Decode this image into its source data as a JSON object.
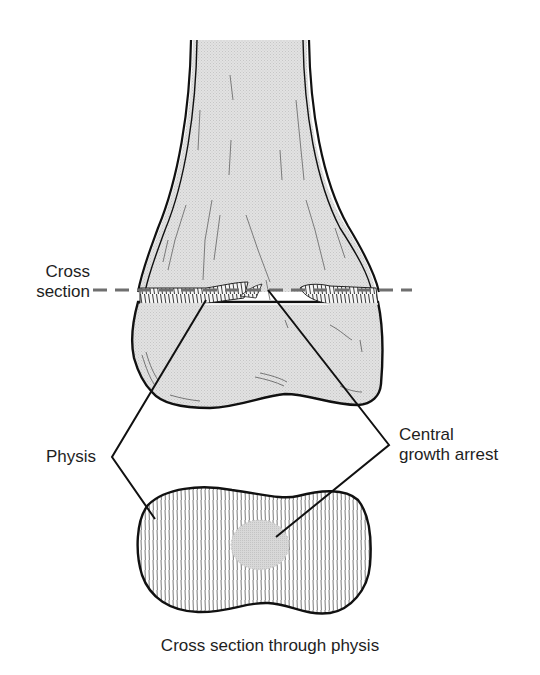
{
  "figure": {
    "colors": {
      "bone_fill": "#dcdcdc",
      "outline": "#111111",
      "dashed_line": "#6f6f6f",
      "arrest_fill": "#d4d4d4",
      "background": "#ffffff"
    }
  },
  "labels": {
    "cross_section": [
      "Cross",
      "section"
    ],
    "physis": "Physis",
    "central_growth_arrest": [
      "Central",
      "growth arrest"
    ],
    "caption": "Cross section through physis"
  },
  "diagram": {
    "elements": [
      {
        "id": "femur-diaphysis",
        "description": "Distal femur shaft flaring into metaphysis"
      },
      {
        "id": "physis-band",
        "description": "Growth plate band with gap at center (bony bar)"
      },
      {
        "id": "epiphysis",
        "description": "Distal femoral epiphysis / condyles"
      },
      {
        "id": "cross-section-plane",
        "description": "Dashed horizontal line marking section level"
      },
      {
        "id": "physis-cross-section",
        "description": "Axial view of physis with hatched cartilage"
      },
      {
        "id": "central-arrest-zone",
        "description": "Gray circular zone of central growth arrest"
      }
    ],
    "leader_lines": [
      {
        "from": "Physis",
        "to": [
          "physis-band",
          "physis-cross-section"
        ]
      },
      {
        "from": "Central growth arrest",
        "to": [
          "physis-band-center",
          "central-arrest-zone"
        ]
      }
    ]
  }
}
